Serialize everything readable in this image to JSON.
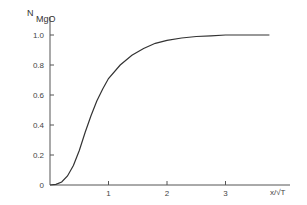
{
  "chart_data": {
    "type": "line",
    "title": "",
    "ylabel": "N",
    "ylabel_subscript": "MgO",
    "xlabel": "x/√T",
    "xlim": [
      0,
      3.75
    ],
    "ylim": [
      0,
      1.0
    ],
    "grid": false,
    "legend": null,
    "x_ticks": [
      "1",
      "2",
      "3"
    ],
    "x_tick_values": [
      1,
      2,
      3
    ],
    "y_ticks": [
      "0",
      "0.2",
      "0.4",
      "0.6",
      "0.8",
      "1.0"
    ],
    "y_tick_values": [
      0,
      0.2,
      0.4,
      0.6,
      0.8,
      1.0
    ],
    "series": [
      {
        "name": "N_MgO",
        "x": [
          0,
          0.1,
          0.2,
          0.3,
          0.4,
          0.5,
          0.6,
          0.7,
          0.8,
          0.9,
          1.0,
          1.2,
          1.4,
          1.6,
          1.8,
          2.0,
          2.25,
          2.5,
          2.75,
          3.0,
          3.25,
          3.5,
          3.75
        ],
        "y": [
          0,
          0.005,
          0.02,
          0.06,
          0.13,
          0.23,
          0.35,
          0.46,
          0.56,
          0.64,
          0.71,
          0.8,
          0.865,
          0.91,
          0.945,
          0.965,
          0.98,
          0.99,
          0.995,
          1.0,
          1.0,
          1.0,
          1.0
        ]
      }
    ]
  }
}
